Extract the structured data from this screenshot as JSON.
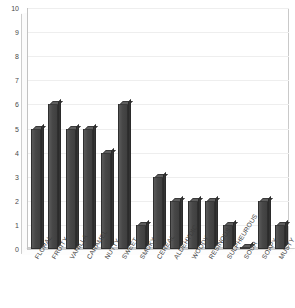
{
  "chart_data": {
    "type": "bar",
    "title": "",
    "subtitle": "",
    "xlabel": "",
    "ylabel": "",
    "ylim": [
      0,
      10
    ],
    "ytick_step": 1,
    "yticks": [
      "10",
      "9",
      "8",
      "7",
      "6",
      "5",
      "4",
      "3",
      "2",
      "1",
      "0"
    ],
    "grid": true,
    "legend": false,
    "legend_position": "none",
    "categories": [
      "FLORAL",
      "FRUITY",
      "VANILLA",
      "CARAMEL",
      "NUTTY",
      "SWEET",
      "SMOKY",
      "CEREAL",
      "ALDEHYDIC",
      "WOODY",
      "RESINOUS",
      "SULPHEUROUS",
      "SOUR",
      "SOAPY",
      "MUSTY"
    ],
    "values": [
      5,
      6,
      5,
      5,
      4,
      6,
      1,
      3,
      2,
      2,
      2,
      1,
      0,
      2,
      1
    ],
    "bar_color": "#4d4d4d",
    "bar_top_color": "#5e5e5e",
    "bar_side_color": "#343434",
    "plot_background": "#ffffff",
    "axis_color": "#c2c2c2",
    "gridline_color": "#eeeeee"
  },
  "title_remnant": ""
}
